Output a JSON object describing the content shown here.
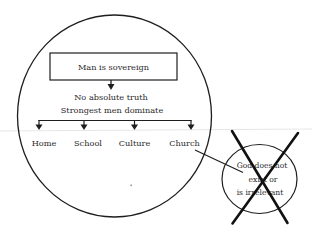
{
  "diagram": {
    "type": "worldview-diagram",
    "colors": {
      "background": "#ffffff",
      "stroke": "#1e1e1e",
      "text": "#2a2a2a",
      "scan_line": "#e6e6e6"
    },
    "main_circle": {
      "box_label": "Man is sovereign",
      "line1": "No absolute truth",
      "line2": "Strongest men dominate",
      "branches": [
        {
          "label": "Home"
        },
        {
          "label": "School"
        },
        {
          "label": "Culture"
        },
        {
          "label": "Church"
        }
      ]
    },
    "crossed_circle": {
      "lines": [
        "God does not",
        "exist or",
        "is irrelevant"
      ],
      "crossed_out": true,
      "connected_to": "Church"
    }
  }
}
